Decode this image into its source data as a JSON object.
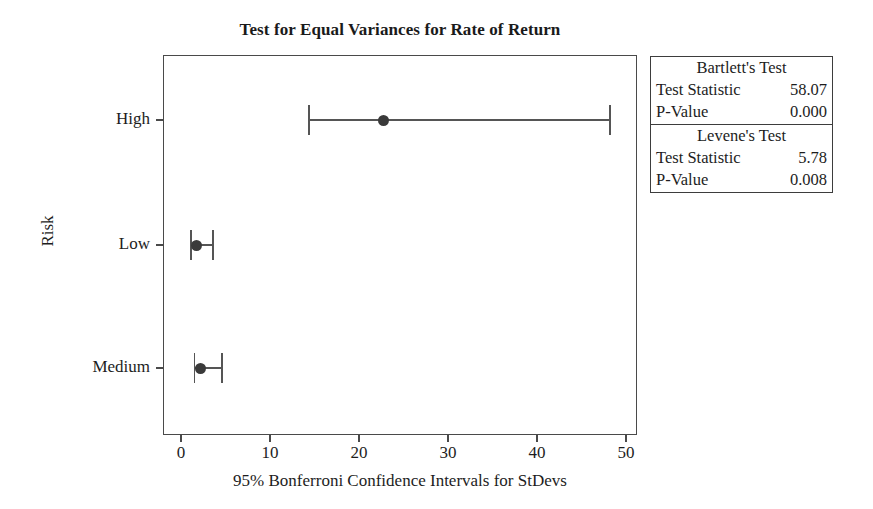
{
  "chart_data": {
    "type": "scatter",
    "title": "Test for Equal Variances for Rate of Return",
    "xlabel": "95% Bonferroni Confidence Intervals for StDevs",
    "ylabel": "Risk",
    "xlim": [
      0,
      53.5
    ],
    "xticks": [
      0,
      10,
      20,
      30,
      40,
      50
    ],
    "xtick_labels": [
      "0",
      "10",
      "20",
      "30",
      "40",
      "50"
    ],
    "categories": [
      "High",
      "Low",
      "Medium"
    ],
    "grid": false,
    "legend_position": "outside-right-top",
    "series": [
      {
        "name": "95% Bonferroni CI for StDev",
        "points": [
          {
            "category": "High",
            "estimate": 22.7,
            "lower": 14.4,
            "upper": 48.2
          },
          {
            "category": "Low",
            "estimate": 1.7,
            "lower": 1.1,
            "upper": 3.6
          },
          {
            "category": "Medium",
            "estimate": 2.2,
            "lower": 1.5,
            "upper": 4.6
          }
        ]
      }
    ],
    "annotations": {
      "tests": [
        {
          "heading": "Bartlett's Test",
          "rows": [
            {
              "label": "Test Statistic",
              "value": "58.07"
            },
            {
              "label": "P-Value",
              "value": "0.000"
            }
          ]
        },
        {
          "heading": "Levene's Test",
          "rows": [
            {
              "label": "Test Statistic",
              "value": "5.78"
            },
            {
              "label": "P-Value",
              "value": "0.008"
            }
          ]
        }
      ]
    },
    "colors": {
      "marker": "#3a3a3a",
      "interval_line": "#555555",
      "axis": "#4a4a4a",
      "text": "#1d1d1d",
      "background": "#ffffff"
    }
  }
}
